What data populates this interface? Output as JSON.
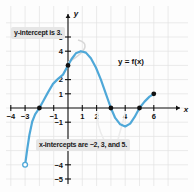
{
  "figure": {
    "function_label": "y = f(x)",
    "callouts": {
      "y_intercept": "y-intercept is 3.",
      "x_intercepts": "x-intercepts are −2, 3, and 5."
    },
    "axis_labels": {
      "x": "x",
      "y": "y"
    },
    "colors": {
      "curve": "#4FA8D8",
      "point": "#111111",
      "grid": "#e2e2e2",
      "axis": "#111111",
      "callout_bg": "#e6e6e6",
      "background": "#fdfdfd"
    }
  },
  "chart_data": {
    "type": "line",
    "title": "",
    "xlabel": "x",
    "ylabel": "y",
    "xlim": [
      -5,
      7
    ],
    "ylim": [
      -6,
      6
    ],
    "grid": true,
    "legend": "none",
    "x_ticks": [
      -4,
      -3,
      -1,
      1,
      2,
      4,
      6
    ],
    "x_tick_labels": [
      "−4",
      "−3",
      "−1",
      "1",
      "2",
      "4",
      "6"
    ],
    "y_ticks": [
      5,
      4,
      2,
      1,
      -1,
      -4,
      -5
    ],
    "y_tick_labels": [
      "5",
      "4",
      "2",
      "1",
      "−1",
      "−4",
      "−5"
    ],
    "series": [
      {
        "name": "y = f(x)",
        "color": "#4FA8D8",
        "points": [
          [
            -3.0,
            -4.0
          ],
          [
            -2.85,
            -2.9
          ],
          [
            -2.7,
            -1.9
          ],
          [
            -2.5,
            -0.95
          ],
          [
            -2.3,
            -0.45
          ],
          [
            -2.0,
            0.0
          ],
          [
            -1.7,
            0.55
          ],
          [
            -1.4,
            1.1
          ],
          [
            -1.05,
            1.7
          ],
          [
            -0.7,
            2.05
          ],
          [
            -0.35,
            2.35
          ],
          [
            0.0,
            3.0
          ],
          [
            0.25,
            3.45
          ],
          [
            0.55,
            3.85
          ],
          [
            0.9,
            4.0
          ],
          [
            1.25,
            3.9
          ],
          [
            1.6,
            3.5
          ],
          [
            1.95,
            2.85
          ],
          [
            2.3,
            2.0
          ],
          [
            2.65,
            1.0
          ],
          [
            3.0,
            0.0
          ],
          [
            3.3,
            -0.7
          ],
          [
            3.65,
            -1.15
          ],
          [
            4.0,
            -1.3
          ],
          [
            4.35,
            -1.1
          ],
          [
            4.65,
            -0.65
          ],
          [
            5.0,
            0.0
          ],
          [
            5.35,
            0.45
          ],
          [
            5.7,
            0.8
          ],
          [
            6.0,
            1.0
          ]
        ]
      }
    ],
    "marked_points": [
      {
        "x": -2,
        "y": 0,
        "kind": "closed",
        "note": "x-intercept"
      },
      {
        "x": 0,
        "y": 3,
        "kind": "closed",
        "note": "y-intercept"
      },
      {
        "x": 3,
        "y": 0,
        "kind": "closed",
        "note": "x-intercept"
      },
      {
        "x": 5,
        "y": 0,
        "kind": "closed",
        "note": "x-intercept"
      },
      {
        "x": 6,
        "y": 1,
        "kind": "closed",
        "note": "right endpoint"
      },
      {
        "x": -3,
        "y": -4,
        "kind": "open",
        "note": "left endpoint (excluded)"
      }
    ]
  }
}
